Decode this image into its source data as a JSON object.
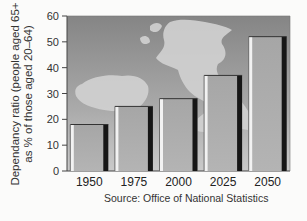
{
  "chart_data": {
    "type": "bar",
    "title": "",
    "xlabel": "",
    "ylabel": "Dependancy ratio (people aged 65+ as % of those aged 20–64)",
    "ylabel_lines": [
      "Dependancy ratio (people aged 65+",
      "as % of those aged 20–64)"
    ],
    "categories": [
      "1950",
      "1975",
      "2000",
      "2025",
      "2050"
    ],
    "values": [
      18,
      25,
      28,
      37,
      52
    ],
    "ylim": [
      0,
      60
    ],
    "yticks": [
      0,
      10,
      20,
      30,
      40,
      50,
      60
    ],
    "grid": false,
    "legend": null,
    "background": "UK and Ireland map silhouette on grey gradient",
    "source": "Source: Office of National Statistics"
  },
  "colors": {
    "bar_fill": "#a8a8a8",
    "bar_highlight": "#f2f2f2",
    "bar_shadow": "#161616",
    "bg_top": "#8a8a8a",
    "bg_bottom": "#c4c4c4",
    "map": "#cfcfcf",
    "axis": "#444444"
  }
}
